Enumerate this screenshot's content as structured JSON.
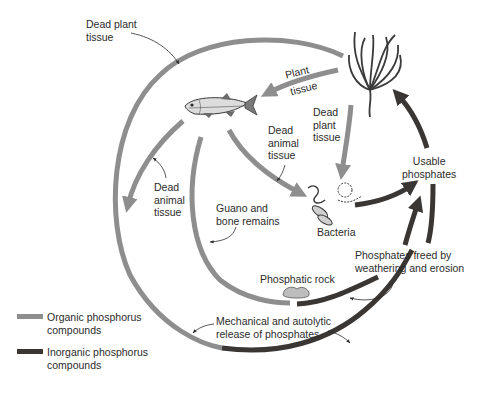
{
  "diagram": {
    "colors": {
      "organic": "#8e8e8e",
      "inorganic": "#3a3633",
      "text": "#2b2b2b",
      "background": "#ffffff"
    },
    "nodes": {
      "plant": "Aquatic plant",
      "fish": "Fish",
      "bacteria": "Bacteria",
      "rock": "Phosphatic rock",
      "usable": "Usable phosphates"
    },
    "labels": {
      "dead_plant_tissue_outer": "Dead plant\ntissue",
      "plant_tissue_1": "Plant",
      "plant_tissue_2": "tissue",
      "dead_plant_tissue_inner": "Dead\nplant\ntissue",
      "dead_animal_tissue_center": "Dead\nanimal\ntissue",
      "dead_animal_tissue_left": "Dead\nanimal\ntissue",
      "guano": "Guano and\nbone remains",
      "bacteria": "Bacteria",
      "usable_phosphates": "Usable\nphosphates",
      "phosphates_freed": "Phosphates freed by\nweathering and erosion",
      "phosphatic_rock": "Phosphatic rock",
      "mechanical_release": "Mechanical and autolytic\nrelease of phosphates"
    },
    "legend": [
      {
        "label": "Organic phosphorus\ncompounds",
        "color": "#8e8e8e"
      },
      {
        "label": "Inorganic phosphorus\ncompounds",
        "color": "#3a3633"
      }
    ]
  }
}
